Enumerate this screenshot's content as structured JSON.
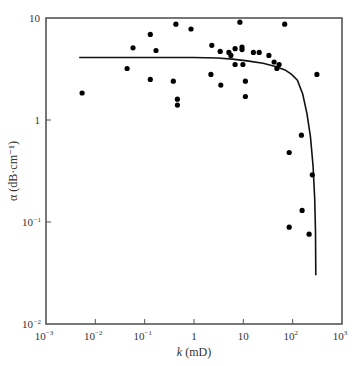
{
  "chart_data": {
    "type": "scatter",
    "title": "",
    "xlabel": "k (mD)",
    "xlabel_italic": "k",
    "xlabel_unit": "(mD)",
    "ylabel": "α (dB·cm⁻¹)",
    "xscale": "log",
    "yscale": "log",
    "xlim": [
      0.001,
      1000
    ],
    "ylim": [
      0.01,
      10
    ],
    "grid": false,
    "legend": null,
    "x_ticks": [
      {
        "value": 0.001,
        "base": "10",
        "exp": "-3"
      },
      {
        "value": 0.01,
        "base": "10",
        "exp": "-2"
      },
      {
        "value": 0.1,
        "base": "10",
        "exp": "-1"
      },
      {
        "value": 1,
        "base": "1",
        "exp": ""
      },
      {
        "value": 10,
        "base": "10",
        "exp": ""
      },
      {
        "value": 100,
        "base": "10",
        "exp": "2"
      },
      {
        "value": 1000,
        "base": "10",
        "exp": "3"
      }
    ],
    "y_ticks": [
      {
        "value": 0.01,
        "base": "10",
        "exp": "-2"
      },
      {
        "value": 0.1,
        "base": "10",
        "exp": "-1"
      },
      {
        "value": 1,
        "base": "1",
        "exp": ""
      },
      {
        "value": 10,
        "base": "10",
        "exp": ""
      }
    ],
    "series": [
      {
        "name": "measured",
        "type": "scatter",
        "color": "#000000",
        "points": [
          [
            0.0054,
            1.84
          ],
          [
            0.044,
            3.2
          ],
          [
            0.058,
            5.1
          ],
          [
            0.13,
            2.5
          ],
          [
            0.13,
            6.9
          ],
          [
            0.17,
            4.8
          ],
          [
            0.38,
            2.4
          ],
          [
            0.43,
            8.7
          ],
          [
            0.46,
            1.6
          ],
          [
            0.46,
            1.4
          ],
          [
            0.87,
            7.8
          ],
          [
            2.2,
            2.8
          ],
          [
            2.3,
            5.4
          ],
          [
            3.4,
            4.7
          ],
          [
            3.5,
            2.2
          ],
          [
            5.1,
            4.6
          ],
          [
            5.6,
            4.3
          ],
          [
            6.8,
            5.0
          ],
          [
            6.8,
            3.5
          ],
          [
            8.5,
            9.1
          ],
          [
            9.4,
            5.2
          ],
          [
            9.4,
            4.9
          ],
          [
            9.8,
            3.5
          ],
          [
            11,
            1.7
          ],
          [
            11,
            2.4
          ],
          [
            16,
            4.6
          ],
          [
            21,
            4.6
          ],
          [
            33,
            4.3
          ],
          [
            42,
            3.7
          ],
          [
            53,
            3.5
          ],
          [
            48,
            3.2
          ],
          [
            69,
            8.7
          ],
          [
            310,
            2.8
          ],
          [
            150,
            0.71
          ],
          [
            85,
            0.48
          ],
          [
            250,
            0.29
          ],
          [
            155,
            0.13
          ],
          [
            85,
            0.089
          ],
          [
            215,
            0.076
          ]
        ]
      },
      {
        "name": "model curve",
        "type": "line",
        "color": "#000000",
        "points": [
          [
            0.0047,
            4.1
          ],
          [
            0.1,
            4.1
          ],
          [
            1,
            4.1
          ],
          [
            3,
            4.05
          ],
          [
            6,
            3.95
          ],
          [
            12,
            3.8
          ],
          [
            25,
            3.6
          ],
          [
            45,
            3.35
          ],
          [
            70,
            3.1
          ],
          [
            95,
            2.8
          ],
          [
            125,
            2.45
          ],
          [
            160,
            1.8
          ],
          [
            195,
            1.15
          ],
          [
            230,
            0.68
          ],
          [
            260,
            0.35
          ],
          [
            280,
            0.17
          ],
          [
            290,
            0.08
          ],
          [
            295,
            0.03
          ]
        ]
      }
    ]
  }
}
